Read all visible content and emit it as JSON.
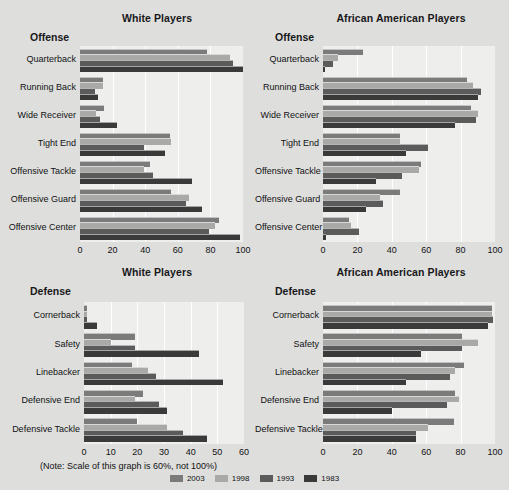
{
  "figure": {
    "background": "#dededc",
    "plot_background": "#eeeeec",
    "note": "(Note: Scale of this graph is 60%, not 100%)"
  },
  "legend": {
    "position": "bottom-center",
    "items": [
      {
        "label": "2003",
        "color": "#7b7b7b"
      },
      {
        "label": "1998",
        "color": "#a9a9a7"
      },
      {
        "label": "1993",
        "color": "#5b5b5b"
      },
      {
        "label": "1983",
        "color": "#3a3a3a"
      }
    ]
  },
  "panels": [
    {
      "id": "white-offense",
      "panel_title": "White Players",
      "group_title": "Offense"
    },
    {
      "id": "aa-offense",
      "panel_title": "African American Players",
      "group_title": "Offense"
    },
    {
      "id": "white-defense",
      "panel_title": "White Players",
      "group_title": "Defense"
    },
    {
      "id": "aa-defense",
      "panel_title": "African American Players",
      "group_title": "Defense"
    }
  ],
  "chart_data": [
    {
      "id": "white-offense",
      "type": "bar",
      "orientation": "horizontal",
      "title": "White Players",
      "subtitle": "Offense",
      "xlabel": "",
      "ylabel": "",
      "xlim": [
        0,
        100
      ],
      "ticks": [
        0,
        20,
        40,
        60,
        80,
        100
      ],
      "grid": true,
      "categories": [
        "Quarterback",
        "Running Back",
        "Wide Receiver",
        "Tight End",
        "Offensive Tackle",
        "Offensive Guard",
        "Offensive Center"
      ],
      "series": [
        {
          "name": "2003",
          "color": "#7b7b7b",
          "values": [
            78,
            14,
            15,
            55,
            43,
            56,
            85
          ]
        },
        {
          "name": "1998",
          "color": "#a9a9a7",
          "values": [
            92,
            14,
            10,
            56,
            39,
            67,
            83
          ]
        },
        {
          "name": "1993",
          "color": "#5b5b5b",
          "values": [
            94,
            9,
            12,
            39,
            45,
            65,
            79
          ]
        },
        {
          "name": "1983",
          "color": "#3a3a3a",
          "values": [
            100,
            11,
            23,
            52,
            69,
            75,
            98
          ]
        }
      ]
    },
    {
      "id": "aa-offense",
      "type": "bar",
      "orientation": "horizontal",
      "title": "African American Players",
      "subtitle": "Offense",
      "xlabel": "",
      "ylabel": "",
      "xlim": [
        0,
        100
      ],
      "ticks": [
        0,
        20,
        40,
        60,
        80,
        100
      ],
      "grid": true,
      "categories": [
        "Quarterback",
        "Running Back",
        "Wide Receiver",
        "Tight End",
        "Offensive Tackle",
        "Offensive Guard",
        "Offensive Center"
      ],
      "series": [
        {
          "name": "2003",
          "color": "#7b7b7b",
          "values": [
            23,
            84,
            86,
            45,
            57,
            45,
            15
          ]
        },
        {
          "name": "1998",
          "color": "#a9a9a7",
          "values": [
            9,
            87,
            90,
            45,
            56,
            33,
            16
          ]
        },
        {
          "name": "1993",
          "color": "#5b5b5b",
          "values": [
            6,
            92,
            89,
            61,
            46,
            35,
            21
          ]
        },
        {
          "name": "1983",
          "color": "#3a3a3a",
          "values": [
            1,
            90,
            77,
            48,
            31,
            25,
            2
          ]
        }
      ]
    },
    {
      "id": "white-defense",
      "type": "bar",
      "orientation": "horizontal",
      "title": "White Players",
      "subtitle": "Defense",
      "xlabel": "",
      "ylabel": "",
      "xlim": [
        0,
        60
      ],
      "ticks": [
        0,
        10,
        20,
        30,
        40,
        50,
        60
      ],
      "grid": true,
      "note": "(Note: Scale of this graph is 60%, not 100%)",
      "categories": [
        "Cornerback",
        "Safety",
        "Linebacker",
        "Defensive End",
        "Defensive Tackle"
      ],
      "series": [
        {
          "name": "2003",
          "color": "#7b7b7b",
          "values": [
            1,
            19,
            18,
            22,
            20
          ]
        },
        {
          "name": "1998",
          "color": "#a9a9a7",
          "values": [
            1,
            10,
            24,
            19,
            31
          ]
        },
        {
          "name": "1993",
          "color": "#5b5b5b",
          "values": [
            1,
            19,
            27,
            28,
            37
          ]
        },
        {
          "name": "1983",
          "color": "#3a3a3a",
          "values": [
            5,
            43,
            52,
            31,
            46
          ]
        }
      ]
    },
    {
      "id": "aa-defense",
      "type": "bar",
      "orientation": "horizontal",
      "title": "African American Players",
      "subtitle": "Defense",
      "xlabel": "",
      "ylabel": "",
      "xlim": [
        0,
        100
      ],
      "ticks": [
        0,
        20,
        40,
        60,
        80,
        100
      ],
      "grid": true,
      "categories": [
        "Cornerback",
        "Safety",
        "Linebacker",
        "Defensive End",
        "Defensive Tackle"
      ],
      "series": [
        {
          "name": "2003",
          "color": "#7b7b7b",
          "values": [
            98,
            81,
            82,
            77,
            76
          ]
        },
        {
          "name": "1998",
          "color": "#a9a9a7",
          "values": [
            98,
            90,
            77,
            79,
            61
          ]
        },
        {
          "name": "1993",
          "color": "#5b5b5b",
          "values": [
            99,
            81,
            74,
            72,
            54
          ]
        },
        {
          "name": "1983",
          "color": "#3a3a3a",
          "values": [
            96,
            57,
            48,
            40,
            54
          ]
        }
      ]
    }
  ]
}
